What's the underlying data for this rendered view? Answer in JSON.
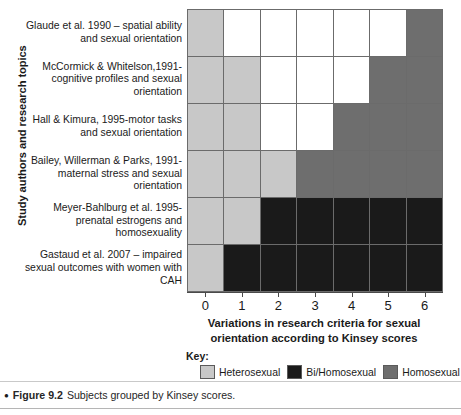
{
  "chart_data": {
    "type": "heatmap",
    "title": "Subjects grouped by Kinsey scores.",
    "xlabel": "Variations in research criteria for sexual orientation according to Kinsey scores",
    "ylabel": "Study authors and research topics",
    "x_tick_labels": [
      "0",
      "1",
      "2",
      "3",
      "4",
      "5",
      "6"
    ],
    "xlim": [
      0,
      6
    ],
    "grid": true,
    "legend_position": "bottom",
    "categories": [
      "Glaude et al. 1990 – spatial ability and sexual orientation",
      "McCormick & Whitelson,1991-cognitive profiles and sexual orientation",
      "Hall & Kimura, 1995-motor tasks and sexual orientation",
      "Bailey, Willerman & Parks, 1991-maternal stress and sexual orientation",
      "Meyer-Bahlburg et al. 1995-prenatal estrogens and homosexuality",
      "Gastaud et al. 2007 – impaired sexual outcomes with women with CAH"
    ],
    "legend_entries": [
      {
        "label": "Heterosexual",
        "key": "heterosexual",
        "color": "#c8c8c8"
      },
      {
        "label": "Bi/Homosexual",
        "key": "bihomosexual",
        "color": "#1a1a1a"
      },
      {
        "label": "Homosexual",
        "key": "homosexual",
        "color": "#6e6e6e"
      }
    ],
    "values": [
      [
        "heterosexual",
        "none",
        "none",
        "none",
        "none",
        "none",
        "homosexual"
      ],
      [
        "heterosexual",
        "heterosexual",
        "none",
        "none",
        "none",
        "homosexual",
        "homosexual"
      ],
      [
        "heterosexual",
        "heterosexual",
        "none",
        "none",
        "homosexual",
        "homosexual",
        "homosexual"
      ],
      [
        "heterosexual",
        "heterosexual",
        "heterosexual",
        "homosexual",
        "homosexual",
        "homosexual",
        "homosexual"
      ],
      [
        "heterosexual",
        "heterosexual",
        "bihomosexual",
        "bihomosexual",
        "bihomosexual",
        "bihomosexual",
        "bihomosexual"
      ],
      [
        "heterosexual",
        "bihomosexual",
        "bihomosexual",
        "bihomosexual",
        "bihomosexual",
        "bihomosexual",
        "bihomosexual"
      ]
    ]
  },
  "axes": {
    "y_title": "Study authors and research topics",
    "x_title_line1": "Variations in research criteria for sexual",
    "x_title_line2": "orientation according to Kinsey scores",
    "x_ticks": [
      "0",
      "1",
      "2",
      "3",
      "4",
      "5",
      "6"
    ]
  },
  "row_labels": [
    "Glaude et al. 1990 – spatial ability and sexual orientation",
    "McCormick & Whitelson,1991-cognitive profiles and sexual orientation",
    "Hall & Kimura, 1995-motor tasks and sexual orientation",
    "Bailey, Willerman & Parks, 1991-maternal stress and sexual orientation",
    "Meyer-Bahlburg et al. 1995-prenatal estrogens and homosexuality",
    "Gastaud et al. 2007 – impaired sexual outcomes with women with CAH"
  ],
  "legend": {
    "title": "Key:",
    "items": [
      {
        "label": "Heterosexual"
      },
      {
        "label": "Bi/Homosexual"
      },
      {
        "label": "Homosexual"
      }
    ]
  },
  "credit": "Adapted from R Jordan Young (2010)",
  "caption": {
    "bullet": "●",
    "figure_number": "Figure 9.2",
    "text": "Subjects grouped by Kinsey scores."
  },
  "colors": {
    "heterosexual": "#c8c8c8",
    "bihomosexual": "#1a1a1a",
    "homosexual": "#6e6e6e",
    "none": "#ffffff",
    "gridline": "#6b6b6b",
    "text": "#1a1a1a"
  }
}
